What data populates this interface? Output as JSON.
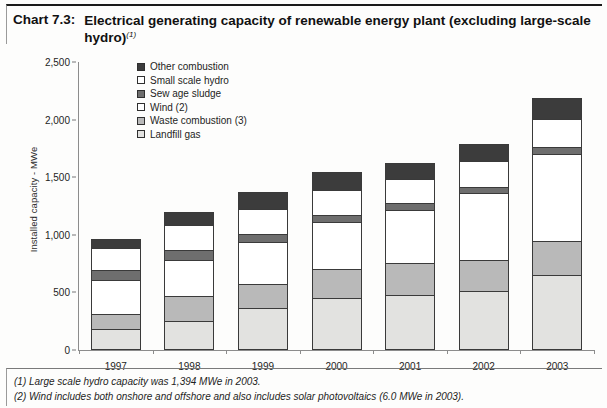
{
  "title": {
    "label": "Chart 7.3:",
    "text": "Electrical generating capacity of renewable energy plant (excluding large-scale hydro)",
    "superscript": "(1)"
  },
  "footnotes": [
    "(1) Large scale hydro capacity was 1,394 MWe in 2003.",
    "(2) Wind includes both onshore and offshore and also includes solar photovoltaics (6.0 MWe in 2003)."
  ],
  "legend": {
    "position": "top-left-inside",
    "items": [
      {
        "label": "Other combustion",
        "color": "#3c3c3c"
      },
      {
        "label": "Small scale hydro",
        "color": "#ffffff"
      },
      {
        "label": "Sew age sludge",
        "color": "#6e6e6e"
      },
      {
        "label": "Wind (2)",
        "color": "#ffffff"
      },
      {
        "label": "Waste combustion (3)",
        "color": "#b9b9b9"
      },
      {
        "label": "Landfill gas",
        "color": "#e2e2e0"
      }
    ]
  },
  "chart_data": {
    "type": "bar",
    "subtype": "stacked-vertical",
    "title": "Electrical generating capacity of renewable energy plant (excluding large-scale hydro)",
    "xlabel": "",
    "ylabel": "Installed capacity - MWe",
    "ylim": [
      0,
      2500
    ],
    "yticks": [
      0,
      500,
      1000,
      1500,
      2000,
      2500
    ],
    "ytick_labels": [
      "0",
      "500",
      "1,000",
      "1,500",
      "2,000",
      "2,500"
    ],
    "grid": false,
    "categories": [
      "1997",
      "1998",
      "1999",
      "2000",
      "2001",
      "2002",
      "2003"
    ],
    "series": [
      {
        "name": "Landfill gas",
        "color": "#e2e2e0",
        "values": [
          165,
          240,
          355,
          440,
          465,
          500,
          640
        ]
      },
      {
        "name": "Waste combustion (3)",
        "color": "#b9b9b9",
        "values": [
          140,
          215,
          210,
          255,
          285,
          270,
          300
        ]
      },
      {
        "name": "Wind (2)",
        "color": "#ffffff",
        "values": [
          295,
          320,
          365,
          415,
          460,
          585,
          760
        ]
      },
      {
        "name": "Sew age sludge",
        "color": "#6e6e6e",
        "values": [
          90,
          90,
          75,
          60,
          60,
          60,
          60
        ]
      },
      {
        "name": "Small scale hydro",
        "color": "#ffffff",
        "values": [
          190,
          215,
          215,
          215,
          215,
          225,
          240
        ]
      },
      {
        "name": "Other combustion",
        "color": "#3c3c3c",
        "values": [
          80,
          115,
          150,
          160,
          140,
          150,
          185
        ]
      }
    ],
    "totals": [
      960,
      1195,
      1370,
      1545,
      1625,
      1790,
      2185
    ]
  }
}
